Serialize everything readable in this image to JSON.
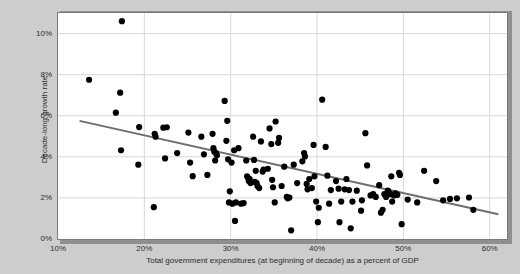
{
  "chart_data": {
    "type": "scatter",
    "title": "",
    "xlabel": "Total government expenditures (at beginning of decade) as a percent of GDP",
    "ylabel": "Decade-long growth rate",
    "xlim": [
      10,
      62
    ],
    "ylim": [
      0,
      11
    ],
    "grid": true,
    "legend": "none",
    "xticks": [
      "10%",
      "20%",
      "30%",
      "40%",
      "50%",
      "60%"
    ],
    "xtick_values": [
      10,
      20,
      30,
      40,
      50,
      60
    ],
    "yticks": [
      "0%",
      "2%",
      "4%",
      "6%",
      "8%",
      "10%"
    ],
    "ytick_values": [
      0,
      2,
      4,
      6,
      8,
      10
    ],
    "marker_color": "#000000",
    "trendline_color": "#6e6e6e",
    "plot_background": "#ffffff",
    "page_background": "#cdcdcd",
    "trendline": {
      "x_start": 12.5,
      "y_start": 5.75,
      "x_end": 61.0,
      "y_end": 1.2
    },
    "points": [
      [
        17.4,
        10.6
      ],
      [
        13.6,
        7.75
      ],
      [
        17.2,
        7.12
      ],
      [
        16.7,
        6.15
      ],
      [
        17.3,
        4.32
      ],
      [
        19.4,
        5.45
      ],
      [
        19.3,
        3.62
      ],
      [
        21.2,
        5.12
      ],
      [
        21.3,
        4.98
      ],
      [
        22.2,
        5.42
      ],
      [
        22.6,
        5.44
      ],
      [
        22.4,
        3.92
      ],
      [
        21.1,
        1.55
      ],
      [
        25.1,
        5.18
      ],
      [
        25.3,
        3.72
      ],
      [
        25.6,
        3.06
      ],
      [
        26.6,
        4.98
      ],
      [
        27.9,
        5.12
      ],
      [
        28.0,
        4.42
      ],
      [
        28.1,
        4.25
      ],
      [
        28.3,
        4.18
      ],
      [
        28.4,
        4.08
      ],
      [
        27.3,
        3.12
      ],
      [
        28.2,
        3.82
      ],
      [
        29.3,
        6.72
      ],
      [
        29.6,
        5.75
      ],
      [
        29.5,
        4.78
      ],
      [
        29.7,
        3.88
      ],
      [
        30.1,
        3.72
      ],
      [
        30.4,
        4.32
      ],
      [
        29.9,
        2.32
      ],
      [
        29.8,
        1.78
      ],
      [
        30.2,
        1.72
      ],
      [
        30.6,
        1.78
      ],
      [
        31.2,
        1.72
      ],
      [
        30.5,
        0.88
      ],
      [
        31.5,
        1.75
      ],
      [
        31.8,
        3.82
      ],
      [
        32.0,
        2.98
      ],
      [
        32.2,
        2.92
      ],
      [
        32.1,
        2.82
      ],
      [
        32.3,
        2.72
      ],
      [
        31.9,
        3.05
      ],
      [
        32.6,
        4.98
      ],
      [
        32.7,
        3.85
      ],
      [
        32.8,
        2.78
      ],
      [
        33.0,
        2.72
      ],
      [
        33.1,
        2.58
      ],
      [
        32.9,
        3.32
      ],
      [
        33.5,
        4.75
      ],
      [
        33.7,
        3.28
      ],
      [
        33.3,
        2.48
      ],
      [
        33.8,
        3.38
      ],
      [
        34.5,
        5.38
      ],
      [
        34.7,
        4.62
      ],
      [
        34.3,
        3.42
      ],
      [
        34.8,
        2.88
      ],
      [
        34.9,
        2.52
      ],
      [
        35.2,
        5.72
      ],
      [
        35.6,
        4.92
      ],
      [
        35.5,
        4.68
      ],
      [
        35.1,
        1.78
      ],
      [
        36.2,
        3.52
      ],
      [
        36.5,
        2.05
      ],
      [
        36.8,
        2.02
      ],
      [
        36.6,
        1.98
      ],
      [
        37.0,
        0.42
      ],
      [
        37.3,
        3.62
      ],
      [
        37.7,
        2.72
      ],
      [
        38.3,
        3.78
      ],
      [
        38.5,
        4.18
      ],
      [
        38.6,
        4.02
      ],
      [
        38.8,
        2.68
      ],
      [
        38.9,
        2.42
      ],
      [
        39.1,
        2.92
      ],
      [
        39.4,
        2.48
      ],
      [
        39.6,
        4.58
      ],
      [
        39.7,
        3.05
      ],
      [
        39.9,
        1.82
      ],
      [
        40.2,
        1.52
      ],
      [
        40.1,
        0.82
      ],
      [
        40.6,
        6.78
      ],
      [
        41.0,
        4.48
      ],
      [
        41.2,
        3.08
      ],
      [
        41.4,
        1.72
      ],
      [
        41.6,
        2.38
      ],
      [
        42.2,
        2.82
      ],
      [
        42.5,
        2.45
      ],
      [
        42.8,
        1.82
      ],
      [
        42.6,
        0.82
      ],
      [
        43.4,
        2.92
      ],
      [
        43.7,
        2.38
      ],
      [
        43.2,
        2.42
      ],
      [
        43.9,
        0.52
      ],
      [
        44.6,
        2.35
      ],
      [
        45.2,
        1.88
      ],
      [
        45.1,
        1.38
      ],
      [
        45.6,
        5.15
      ],
      [
        45.8,
        3.58
      ],
      [
        46.2,
        2.12
      ],
      [
        46.5,
        2.18
      ],
      [
        46.8,
        2.05
      ],
      [
        47.2,
        2.62
      ],
      [
        47.4,
        1.28
      ],
      [
        47.6,
        1.42
      ],
      [
        47.8,
        2.18
      ],
      [
        48.0,
        2.05
      ],
      [
        48.2,
        2.35
      ],
      [
        48.3,
        2.28
      ],
      [
        48.5,
        2.18
      ],
      [
        48.7,
        1.82
      ],
      [
        48.9,
        2.12
      ],
      [
        49.1,
        2.22
      ],
      [
        49.3,
        2.15
      ],
      [
        48.6,
        3.05
      ],
      [
        49.5,
        3.22
      ],
      [
        49.6,
        3.12
      ],
      [
        49.8,
        0.72
      ],
      [
        50.5,
        1.92
      ],
      [
        51.6,
        1.78
      ],
      [
        52.4,
        3.32
      ],
      [
        53.8,
        2.82
      ],
      [
        54.6,
        1.88
      ],
      [
        55.4,
        1.95
      ],
      [
        56.2,
        1.98
      ],
      [
        57.6,
        2.02
      ],
      [
        58.1,
        1.42
      ],
      [
        44.1,
        1.82
      ],
      [
        26.9,
        4.12
      ],
      [
        23.8,
        4.18
      ],
      [
        35.9,
        2.58
      ],
      [
        30.9,
        4.42
      ]
    ]
  },
  "axis": {
    "y_title": "Decade-long growth rate",
    "x_title": "Total government expenditures (at beginning of decade) as a percent of GDP"
  }
}
